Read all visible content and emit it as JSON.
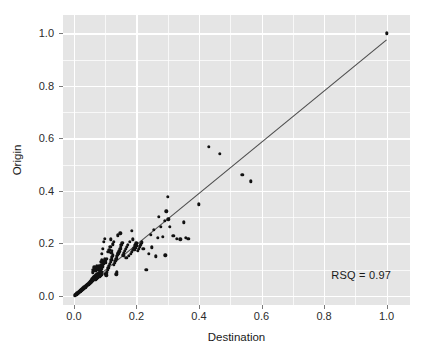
{
  "chart_data": {
    "type": "scatter",
    "title": "",
    "xlabel": "Destination",
    "ylabel": "Origin",
    "xlim": [
      -0.035,
      1.075
    ],
    "ylim": [
      -0.035,
      1.07
    ],
    "xticks": [
      0.0,
      0.2,
      0.4,
      0.6,
      0.8,
      1.0
    ],
    "xticklabels": [
      "0.0",
      "0.2",
      "0.4",
      "0.6",
      "0.8",
      "1.0"
    ],
    "yticks": [
      0.0,
      0.2,
      0.4,
      0.6,
      0.8,
      1.0
    ],
    "yticklabels": [
      "0.0",
      "0.2",
      "0.4",
      "0.6",
      "0.8",
      "1.0"
    ],
    "grid": true,
    "grid_color": "#FFFFFF",
    "panel_background": "#E5E5E5",
    "figure_background": "#FFFFFF",
    "legend": null,
    "annotations": [
      {
        "text": "RSQ = 0.97",
        "x": 0.93,
        "y": 0.075,
        "align": "right"
      }
    ],
    "marker": {
      "shape": "circle",
      "color": "#111111",
      "size": 3.4
    },
    "fit_line": {
      "type": "linear",
      "color": "#4d4d4d",
      "width": 1.1,
      "x0": 0.0,
      "y0": 0.0,
      "x1": 1.0,
      "y1": 0.975
    },
    "points": [
      [
        0.003,
        0.002
      ],
      [
        0.005,
        0.004
      ],
      [
        0.006,
        0.003
      ],
      [
        0.007,
        0.006
      ],
      [
        0.008,
        0.005
      ],
      [
        0.009,
        0.008
      ],
      [
        0.01,
        0.007
      ],
      [
        0.011,
        0.01
      ],
      [
        0.012,
        0.009
      ],
      [
        0.013,
        0.012
      ],
      [
        0.014,
        0.011
      ],
      [
        0.015,
        0.014
      ],
      [
        0.016,
        0.013
      ],
      [
        0.017,
        0.016
      ],
      [
        0.018,
        0.015
      ],
      [
        0.019,
        0.018
      ],
      [
        0.02,
        0.017
      ],
      [
        0.021,
        0.02
      ],
      [
        0.022,
        0.019
      ],
      [
        0.023,
        0.022
      ],
      [
        0.024,
        0.021
      ],
      [
        0.025,
        0.024
      ],
      [
        0.026,
        0.023
      ],
      [
        0.027,
        0.026
      ],
      [
        0.028,
        0.025
      ],
      [
        0.029,
        0.028
      ],
      [
        0.03,
        0.027
      ],
      [
        0.031,
        0.03
      ],
      [
        0.032,
        0.029
      ],
      [
        0.033,
        0.032
      ],
      [
        0.034,
        0.031
      ],
      [
        0.035,
        0.034
      ],
      [
        0.036,
        0.033
      ],
      [
        0.037,
        0.036
      ],
      [
        0.038,
        0.035
      ],
      [
        0.039,
        0.038
      ],
      [
        0.04,
        0.037
      ],
      [
        0.041,
        0.04
      ],
      [
        0.042,
        0.039
      ],
      [
        0.043,
        0.042
      ],
      [
        0.044,
        0.041
      ],
      [
        0.045,
        0.044
      ],
      [
        0.046,
        0.043
      ],
      [
        0.047,
        0.046
      ],
      [
        0.048,
        0.045
      ],
      [
        0.049,
        0.048
      ],
      [
        0.05,
        0.047
      ],
      [
        0.051,
        0.052
      ],
      [
        0.052,
        0.05
      ],
      [
        0.053,
        0.055
      ],
      [
        0.054,
        0.051
      ],
      [
        0.055,
        0.058
      ],
      [
        0.056,
        0.054
      ],
      [
        0.057,
        0.061
      ],
      [
        0.058,
        0.056
      ],
      [
        0.059,
        0.064
      ],
      [
        0.06,
        0.059
      ],
      [
        0.061,
        0.067
      ],
      [
        0.062,
        0.062
      ],
      [
        0.063,
        0.07
      ],
      [
        0.064,
        0.065
      ],
      [
        0.065,
        0.073
      ],
      [
        0.066,
        0.068
      ],
      [
        0.067,
        0.06
      ],
      [
        0.068,
        0.076
      ],
      [
        0.069,
        0.071
      ],
      [
        0.07,
        0.063
      ],
      [
        0.071,
        0.079
      ],
      [
        0.072,
        0.074
      ],
      [
        0.073,
        0.066
      ],
      [
        0.074,
        0.082
      ],
      [
        0.075,
        0.077
      ],
      [
        0.076,
        0.069
      ],
      [
        0.077,
        0.085
      ],
      [
        0.078,
        0.08
      ],
      [
        0.079,
        0.072
      ],
      [
        0.08,
        0.088
      ],
      [
        0.081,
        0.083
      ],
      [
        0.082,
        0.075
      ],
      [
        0.083,
        0.091
      ],
      [
        0.084,
        0.086
      ],
      [
        0.085,
        0.078
      ],
      [
        0.086,
        0.094
      ],
      [
        0.087,
        0.089
      ],
      [
        0.088,
        0.081
      ],
      [
        0.06,
        0.09
      ],
      [
        0.062,
        0.1
      ],
      [
        0.065,
        0.108
      ],
      [
        0.068,
        0.095
      ],
      [
        0.07,
        0.104
      ],
      [
        0.073,
        0.112
      ],
      [
        0.075,
        0.098
      ],
      [
        0.078,
        0.106
      ],
      [
        0.08,
        0.115
      ],
      [
        0.083,
        0.101
      ],
      [
        0.085,
        0.11
      ],
      [
        0.088,
        0.118
      ],
      [
        0.09,
        0.103
      ],
      [
        0.092,
        0.112
      ],
      [
        0.095,
        0.121
      ],
      [
        0.088,
        0.129
      ],
      [
        0.09,
        0.136
      ],
      [
        0.093,
        0.123
      ],
      [
        0.095,
        0.131
      ],
      [
        0.098,
        0.139
      ],
      [
        0.1,
        0.126
      ],
      [
        0.102,
        0.134
      ],
      [
        0.105,
        0.142
      ],
      [
        0.09,
        0.16
      ],
      [
        0.092,
        0.18
      ],
      [
        0.095,
        0.205
      ],
      [
        0.098,
        0.218
      ],
      [
        0.1,
        0.085
      ],
      [
        0.103,
        0.078
      ],
      [
        0.106,
        0.09
      ],
      [
        0.108,
        0.098
      ],
      [
        0.11,
        0.106
      ],
      [
        0.112,
        0.114
      ],
      [
        0.115,
        0.122
      ],
      [
        0.118,
        0.13
      ],
      [
        0.12,
        0.138
      ],
      [
        0.122,
        0.146
      ],
      [
        0.125,
        0.154
      ],
      [
        0.128,
        0.118
      ],
      [
        0.13,
        0.126
      ],
      [
        0.132,
        0.134
      ],
      [
        0.135,
        0.142
      ],
      [
        0.138,
        0.15
      ],
      [
        0.14,
        0.158
      ],
      [
        0.11,
        0.168
      ],
      [
        0.113,
        0.176
      ],
      [
        0.116,
        0.186
      ],
      [
        0.119,
        0.163
      ],
      [
        0.122,
        0.172
      ],
      [
        0.125,
        0.196
      ],
      [
        0.128,
        0.205
      ],
      [
        0.118,
        0.215
      ],
      [
        0.135,
        0.082
      ],
      [
        0.138,
        0.09
      ],
      [
        0.142,
        0.162
      ],
      [
        0.145,
        0.17
      ],
      [
        0.148,
        0.178
      ],
      [
        0.15,
        0.186
      ],
      [
        0.152,
        0.194
      ],
      [
        0.14,
        0.23
      ],
      [
        0.148,
        0.238
      ],
      [
        0.155,
        0.202
      ],
      [
        0.158,
        0.155
      ],
      [
        0.16,
        0.163
      ],
      [
        0.163,
        0.171
      ],
      [
        0.166,
        0.179
      ],
      [
        0.17,
        0.187
      ],
      [
        0.172,
        0.195
      ],
      [
        0.168,
        0.145
      ],
      [
        0.175,
        0.152
      ],
      [
        0.178,
        0.205
      ],
      [
        0.182,
        0.16
      ],
      [
        0.185,
        0.168
      ],
      [
        0.188,
        0.215
      ],
      [
        0.19,
        0.176
      ],
      [
        0.193,
        0.184
      ],
      [
        0.196,
        0.192
      ],
      [
        0.2,
        0.2
      ],
      [
        0.185,
        0.248
      ],
      [
        0.195,
        0.175
      ],
      [
        0.198,
        0.183
      ],
      [
        0.202,
        0.191
      ],
      [
        0.205,
        0.172
      ],
      [
        0.208,
        0.18
      ],
      [
        0.21,
        0.188
      ],
      [
        0.214,
        0.196
      ],
      [
        0.218,
        0.204
      ],
      [
        0.222,
        0.178
      ],
      [
        0.232,
        0.098
      ],
      [
        0.24,
        0.16
      ],
      [
        0.245,
        0.232
      ],
      [
        0.25,
        0.185
      ],
      [
        0.255,
        0.252
      ],
      [
        0.262,
        0.15
      ],
      [
        0.268,
        0.222
      ],
      [
        0.272,
        0.3
      ],
      [
        0.278,
        0.262
      ],
      [
        0.284,
        0.225
      ],
      [
        0.29,
        0.285
      ],
      [
        0.292,
        0.155
      ],
      [
        0.296,
        0.322
      ],
      [
        0.3,
        0.378
      ],
      [
        0.302,
        0.292
      ],
      [
        0.306,
        0.262
      ],
      [
        0.318,
        0.228
      ],
      [
        0.33,
        0.218
      ],
      [
        0.34,
        0.215
      ],
      [
        0.352,
        0.28
      ],
      [
        0.358,
        0.222
      ],
      [
        0.366,
        0.218
      ],
      [
        0.4,
        0.348
      ],
      [
        0.432,
        0.568
      ],
      [
        0.466,
        0.54
      ],
      [
        0.538,
        0.462
      ],
      [
        0.566,
        0.436
      ],
      [
        1.0,
        1.0
      ]
    ]
  }
}
